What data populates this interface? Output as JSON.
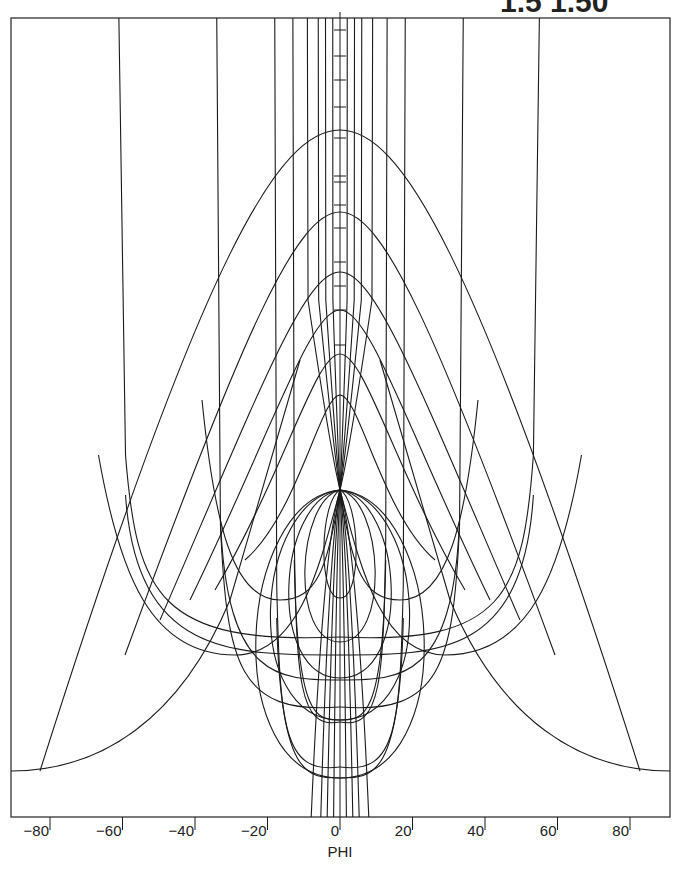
{
  "header": {
    "title_fragment": "1.5   1.50"
  },
  "chart_data": {
    "type": "line",
    "title": "",
    "xlabel": "PHI",
    "ylabel": "",
    "xlim": [
      -91,
      92
    ],
    "grid": false,
    "legend": null,
    "x_ticks": [
      -80,
      -60,
      -40,
      -20,
      0,
      20,
      40,
      60,
      80
    ],
    "x_tick_labels": [
      "−80",
      "−60",
      "−40",
      "−20",
      "0",
      "20",
      "40",
      "60",
      "80"
    ],
    "center_axis_tick_y_px": [
      30,
      56,
      80,
      107,
      138,
      176,
      182,
      205,
      228,
      262,
      286,
      310,
      345
    ],
    "pole": {
      "phi": 0,
      "y_px": 490
    },
    "meridians_phi_top": [
      -61,
      -34,
      -18,
      -13,
      -9,
      -6,
      -4,
      -2,
      2,
      4,
      6,
      9,
      13,
      18,
      34,
      55
    ],
    "meridians": [
      {
        "phi_top": -61,
        "bottom_y_px": 610,
        "bottom_phi": -52
      },
      {
        "phi_top": -34,
        "bottom_y_px": 680,
        "bottom_phi": -26
      },
      {
        "phi_top": -18,
        "bottom_y_px": 740,
        "bottom_phi": -16
      },
      {
        "phi_top": 18,
        "bottom_y_px": 740,
        "bottom_phi": 16
      },
      {
        "phi_top": 34,
        "bottom_y_px": 680,
        "bottom_phi": 26
      },
      {
        "phi_top": 55,
        "bottom_y_px": 610,
        "bottom_phi": 52
      }
    ],
    "outer_wings": [
      {
        "side": "left",
        "phi_start": -91,
        "y_start_px": 771,
        "y_apex_px": 130
      },
      {
        "side": "right",
        "phi_end": 92,
        "y_end_px": 771,
        "y_apex_px": 130
      }
    ],
    "parallels_apex_y_px": [
      130,
      212,
      272,
      310,
      354,
      395
    ],
    "loops_bottom_y_px": [
      598,
      642,
      678,
      720,
      778
    ]
  }
}
